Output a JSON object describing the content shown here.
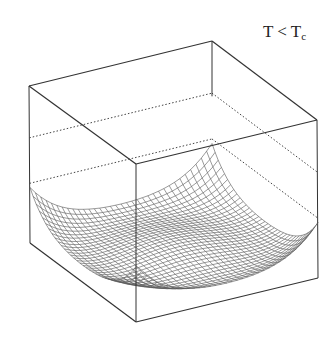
{
  "figure": {
    "label_main": "T < T",
    "label_sub": "c"
  },
  "chart_data": {
    "type": "surface",
    "title": "T < Tc",
    "xlabel": "",
    "ylabel": "",
    "zlabel": "",
    "function": "z = a*(x^2+y^2)^2 - b*(x^2+y^2) + c, square domain, corners rise steeply",
    "grid": {
      "n": 34,
      "range": [
        -1,
        1
      ]
    },
    "params": {
      "a": 1.0,
      "b": 0.55,
      "zmin": -0.08,
      "zmax": 4.0
    },
    "box": {
      "top": {
        "back": [
          212,
          41
        ],
        "left": [
          29,
          86
        ],
        "front": [
          136,
          164
        ],
        "right": [
          317,
          120
        ]
      },
      "bottom": {
        "back": [
          212,
          199
        ],
        "left": [
          30,
          243
        ],
        "front": [
          136,
          322
        ],
        "right": [
          318,
          278
        ]
      }
    },
    "dotted_levels": [
      0.33,
      0.62
    ],
    "colors": {
      "mesh": "#555555",
      "box": "#333333",
      "dotted": "#444444"
    }
  }
}
